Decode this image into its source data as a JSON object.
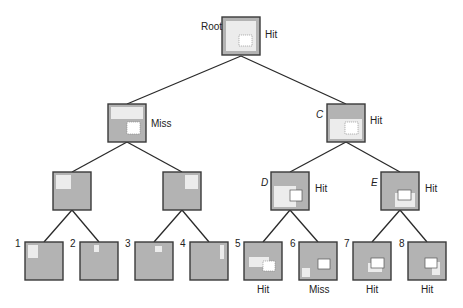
{
  "diagram": {
    "colors": {
      "edge": "#2a2a2a",
      "node_fill": "#b3b3b3",
      "node_border": "#3a3a3a",
      "region_light": "#ececec",
      "region_white": "#ffffff",
      "label": "#222222"
    },
    "nodes": [
      {
        "id": "root",
        "label": "Root",
        "result": "Hit",
        "x": 222,
        "y": 17,
        "size": 38
      },
      {
        "id": "l1a",
        "label": "",
        "result": "Miss",
        "x": 108,
        "y": 104,
        "size": 38
      },
      {
        "id": "C",
        "label": "C",
        "result": "Hit",
        "x": 327,
        "y": 104,
        "size": 38
      },
      {
        "id": "l2a",
        "label": "",
        "result": "",
        "x": 53,
        "y": 172,
        "size": 38
      },
      {
        "id": "l2b",
        "label": "",
        "result": "",
        "x": 163,
        "y": 172,
        "size": 38
      },
      {
        "id": "D",
        "label": "D",
        "result": "Hit",
        "x": 271,
        "y": 172,
        "size": 38
      },
      {
        "id": "E",
        "label": "E",
        "result": "Hit",
        "x": 381,
        "y": 172,
        "size": 38
      },
      {
        "id": "n1",
        "label": "1",
        "result": "",
        "x": 25,
        "y": 242,
        "size": 38
      },
      {
        "id": "n2",
        "label": "2",
        "result": "",
        "x": 80,
        "y": 242,
        "size": 38
      },
      {
        "id": "n3",
        "label": "3",
        "result": "",
        "x": 135,
        "y": 242,
        "size": 38
      },
      {
        "id": "n4",
        "label": "4",
        "result": "",
        "x": 190,
        "y": 242,
        "size": 38
      },
      {
        "id": "n5",
        "label": "5",
        "result": "Hit",
        "x": 244,
        "y": 242,
        "size": 38
      },
      {
        "id": "n6",
        "label": "6",
        "result": "Miss",
        "x": 299,
        "y": 242,
        "size": 38
      },
      {
        "id": "n7",
        "label": "7",
        "result": "Hit",
        "x": 353,
        "y": 242,
        "size": 38
      },
      {
        "id": "n8",
        "label": "8",
        "result": "Hit",
        "x": 408,
        "y": 242,
        "size": 38
      }
    ],
    "edges": [
      [
        "root",
        "l1a"
      ],
      [
        "root",
        "C"
      ],
      [
        "l1a",
        "l2a"
      ],
      [
        "l1a",
        "l2b"
      ],
      [
        "C",
        "D"
      ],
      [
        "C",
        "E"
      ],
      [
        "l2a",
        "n1"
      ],
      [
        "l2a",
        "n2"
      ],
      [
        "l2b",
        "n3"
      ],
      [
        "l2b",
        "n4"
      ],
      [
        "D",
        "n5"
      ],
      [
        "D",
        "n6"
      ],
      [
        "E",
        "n7"
      ],
      [
        "E",
        "n8"
      ]
    ]
  }
}
